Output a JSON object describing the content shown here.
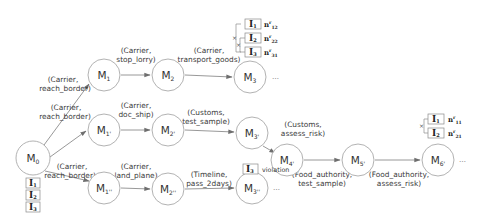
{
  "diagram": {
    "title": "",
    "nodes": [
      {
        "id": "M0",
        "base": "M",
        "sub": "0",
        "x": 33,
        "y": 158
      },
      {
        "id": "M1",
        "base": "M",
        "sub": "1",
        "x": 104,
        "y": 75
      },
      {
        "id": "M2",
        "base": "M",
        "sub": "2",
        "x": 168,
        "y": 75
      },
      {
        "id": "M3",
        "base": "M",
        "sub": "3",
        "x": 250,
        "y": 77
      },
      {
        "id": "M1p",
        "base": "M",
        "sub": "1'",
        "x": 104,
        "y": 130
      },
      {
        "id": "M2p",
        "base": "M",
        "sub": "2'",
        "x": 168,
        "y": 130
      },
      {
        "id": "M3p",
        "base": "M",
        "sub": "3'",
        "x": 252,
        "y": 133
      },
      {
        "id": "M4p",
        "base": "M",
        "sub": "4'",
        "x": 287,
        "y": 160
      },
      {
        "id": "M5p",
        "base": "M",
        "sub": "5'",
        "x": 358,
        "y": 160
      },
      {
        "id": "M6p",
        "base": "M",
        "sub": "6'",
        "x": 438,
        "y": 160
      },
      {
        "id": "M1pp",
        "base": "M",
        "sub": "1''",
        "x": 104,
        "y": 188
      },
      {
        "id": "M2pp",
        "base": "M",
        "sub": "2''",
        "x": 168,
        "y": 189
      },
      {
        "id": "M3pp",
        "base": "M",
        "sub": "3''",
        "x": 252,
        "y": 188
      }
    ],
    "edges": [
      {
        "from": "M0",
        "to": "M1",
        "label_line1": "(Carrier,",
        "label_line2": "reach_border)"
      },
      {
        "from": "M1",
        "to": "M2",
        "label_line1": "(Carrier,",
        "label_line2": "stop_lorry)"
      },
      {
        "from": "M2",
        "to": "M3",
        "label_line1": "(Carrier,",
        "label_line2": "transport_goods)"
      },
      {
        "from": "M0",
        "to": "M1p",
        "label_line1": "(Carrier,",
        "label_line2": "reach_border)"
      },
      {
        "from": "M1p",
        "to": "M2p",
        "label_line1": "(Carrier,",
        "label_line2": "doc_ship)"
      },
      {
        "from": "M2p",
        "to": "M3p",
        "label_line1": "(Customs,",
        "label_line2": "test_sample)"
      },
      {
        "from": "M3p",
        "to": "M4p",
        "label_line1": "(Customs,",
        "label_line2": "assess_risk)"
      },
      {
        "from": "M4p",
        "to": "M5p",
        "label_line1": "(Food_authority,",
        "label_line2": "test_sample)"
      },
      {
        "from": "M5p",
        "to": "M6p",
        "label_line1": "(Food_authority,",
        "label_line2": "assess_risk)"
      },
      {
        "from": "M0",
        "to": "M1pp",
        "label_line1": "(Carrier,",
        "label_line2": "reach_border)"
      },
      {
        "from": "M1pp",
        "to": "M2pp",
        "label_line1": "(Carrier,",
        "label_line2": "land_plane)"
      },
      {
        "from": "M2pp",
        "to": "M3pp",
        "label_line1": "(Timeline,",
        "label_line2": "pass_2days)"
      }
    ],
    "continuation": "…",
    "initial_items": [
      {
        "label": "I",
        "sub": "1"
      },
      {
        "label": "I",
        "sub": "2"
      },
      {
        "label": "I",
        "sub": "3"
      }
    ],
    "m3_items": [
      {
        "label": "I",
        "sub": "1",
        "n_base": "n",
        "n_sup": "r",
        "n_sub": "12"
      },
      {
        "label": "I",
        "sub": "2",
        "n_base": "n",
        "n_sup": "r",
        "n_sub": "22"
      },
      {
        "label": "I",
        "sub": "3",
        "n_base": "n",
        "n_sup": "r",
        "n_sub": "31"
      }
    ],
    "m6p_items": [
      {
        "label": "I",
        "sub": "1",
        "n_base": "n",
        "n_sup": "r",
        "n_sub": "11"
      },
      {
        "label": "I",
        "sub": "2",
        "n_base": "n",
        "n_sup": "r",
        "n_sub": "21"
      }
    ],
    "violation": {
      "item_label": "I",
      "item_sub": "3",
      "text": "violation"
    },
    "x_mark": "×"
  }
}
